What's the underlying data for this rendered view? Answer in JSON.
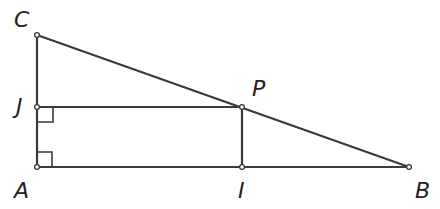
{
  "diagram": {
    "type": "geometry",
    "points": {
      "C": {
        "label": "C",
        "x": 37,
        "y": 35
      },
      "J": {
        "label": "J",
        "x": 37,
        "y": 107
      },
      "A": {
        "label": "A",
        "x": 37,
        "y": 167
      },
      "P": {
        "label": "P",
        "x": 242,
        "y": 107
      },
      "I": {
        "label": "I",
        "x": 242,
        "y": 167
      },
      "B": {
        "label": "B",
        "x": 409,
        "y": 167
      }
    },
    "segments": [
      [
        "C",
        "A"
      ],
      [
        "C",
        "B"
      ],
      [
        "A",
        "B"
      ],
      [
        "J",
        "P"
      ],
      [
        "P",
        "I"
      ]
    ],
    "right_angles": [
      "J",
      "A"
    ],
    "labels": {
      "C": "C",
      "J": "J",
      "A": "A",
      "P": "P",
      "I": "I",
      "B": "B"
    }
  }
}
